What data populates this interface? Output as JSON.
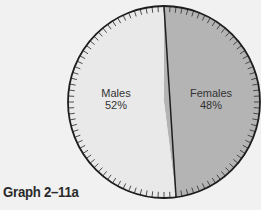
{
  "chart_data": {
    "type": "pie",
    "title": "",
    "caption": "Graph 2–11a",
    "categories": [
      "Females",
      "Males"
    ],
    "values": [
      48,
      52
    ],
    "labels": [
      {
        "name": "Females",
        "pct": "48%"
      },
      {
        "name": "Males",
        "pct": "52%"
      }
    ],
    "colors": {
      "Females": "#b4b4b4",
      "Males": "#e9e9e9"
    },
    "start_angle": "12 o'clock, clockwise",
    "tick_marks": 100,
    "legend": "none (inline labels)"
  }
}
